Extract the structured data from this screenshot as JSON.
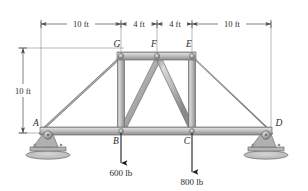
{
  "figure": {
    "units": "ft / lb"
  },
  "dimensions": {
    "horizontal": [
      {
        "label": "10 ft",
        "from": "A",
        "to": "B"
      },
      {
        "label": "4 ft",
        "from": "B",
        "to": "F"
      },
      {
        "label": "4 ft",
        "from": "F",
        "to": "C"
      },
      {
        "label": "10 ft",
        "from": "C",
        "to": "D"
      }
    ],
    "vertical": [
      {
        "label": "10 ft",
        "from": "top-chord",
        "to": "bottom-chord"
      }
    ]
  },
  "nodes": [
    {
      "id": "A",
      "label": "A"
    },
    {
      "id": "B",
      "label": "B"
    },
    {
      "id": "C",
      "label": "C"
    },
    {
      "id": "D",
      "label": "D"
    },
    {
      "id": "E",
      "label": "E"
    },
    {
      "id": "F",
      "label": "F"
    },
    {
      "id": "G",
      "label": "G"
    }
  ],
  "loads": [
    {
      "at": "B",
      "label": "600 lb",
      "direction": "down"
    },
    {
      "at": "C",
      "label": "800 lb",
      "direction": "down"
    }
  ],
  "supports": [
    {
      "at": "A",
      "type": "pin"
    },
    {
      "at": "D",
      "type": "pin"
    }
  ],
  "colors": {
    "member_fill": "#b9b9b9",
    "member_edge": "#6d6d6d",
    "member_highlight": "#dcdcdc",
    "line": "#2b2b2b",
    "dim_line": "#5a5a5a",
    "support_fill": "#9a9a9a",
    "ground_fill": "#c9c9c9",
    "text": "#2b2b2b"
  }
}
